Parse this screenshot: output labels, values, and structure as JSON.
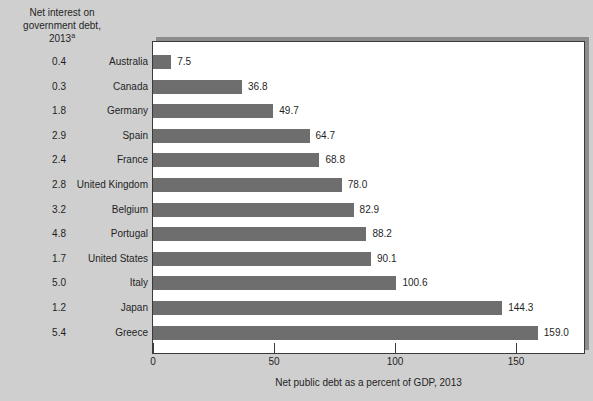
{
  "chart_data": {
    "type": "bar",
    "orientation": "horizontal",
    "title": "",
    "xlabel": "Net public debt as a percent of GDP, 2013",
    "ylabel": "",
    "xlim": [
      0,
      180
    ],
    "xticks": [
      0,
      50,
      100,
      150
    ],
    "xtick_labels": [
      "0",
      "50",
      "100",
      "150"
    ],
    "grid": false,
    "legend": "none",
    "bar_color": "#6e6e6e",
    "background_color": "#cfcfcf",
    "plot_background_color": "#ffffff",
    "categories": [
      "Australia",
      "Canada",
      "Germany",
      "Spain",
      "France",
      "United Kingdom",
      "Belgium",
      "Portugal",
      "United States",
      "Italy",
      "Japan",
      "Greece"
    ],
    "values": [
      7.5,
      36.8,
      49.7,
      64.7,
      68.8,
      78.0,
      82.9,
      88.2,
      90.1,
      100.6,
      144.3,
      159.0
    ],
    "value_labels": [
      "7.5",
      "36.8",
      "49.7",
      "64.7",
      "68.8",
      "78.0",
      "82.9",
      "88.2",
      "90.1",
      "100.6",
      "144.3",
      "159.0"
    ],
    "series": [
      {
        "name": "Net public debt as a percent of GDP, 2013",
        "values": [
          7.5,
          36.8,
          49.7,
          64.7,
          68.8,
          78.0,
          82.9,
          88.2,
          90.1,
          100.6,
          144.3,
          159.0
        ]
      },
      {
        "name": "Net interest on government debt, 2013",
        "values": [
          0.4,
          0.3,
          1.8,
          2.9,
          2.4,
          2.8,
          3.2,
          4.8,
          1.7,
          5.0,
          1.2,
          5.4
        ]
      }
    ]
  },
  "left_header": {
    "line1": "Net interest on",
    "line2": "government debt,",
    "line3": "2013",
    "footnote_marker": "a"
  },
  "rows": [
    {
      "interest": "0.4",
      "country": "Australia",
      "value": "7.5",
      "value_num": 7.5
    },
    {
      "interest": "0.3",
      "country": "Canada",
      "value": "36.8",
      "value_num": 36.8
    },
    {
      "interest": "1.8",
      "country": "Germany",
      "value": "49.7",
      "value_num": 49.7
    },
    {
      "interest": "2.9",
      "country": "Spain",
      "value": "64.7",
      "value_num": 64.7
    },
    {
      "interest": "2.4",
      "country": "France",
      "value": "68.8",
      "value_num": 68.8
    },
    {
      "interest": "2.8",
      "country": "United Kingdom",
      "value": "78.0",
      "value_num": 78.0
    },
    {
      "interest": "3.2",
      "country": "Belgium",
      "value": "82.9",
      "value_num": 82.9
    },
    {
      "interest": "4.8",
      "country": "Portugal",
      "value": "88.2",
      "value_num": 88.2
    },
    {
      "interest": "1.7",
      "country": "United States",
      "value": "90.1",
      "value_num": 90.1
    },
    {
      "interest": "5.0",
      "country": "Italy",
      "value": "100.6",
      "value_num": 100.6
    },
    {
      "interest": "1.2",
      "country": "Japan",
      "value": "144.3",
      "value_num": 144.3
    },
    {
      "interest": "5.4",
      "country": "Greece",
      "value": "159.0",
      "value_num": 159.0
    }
  ],
  "axis": {
    "ticks": [
      {
        "label": "0",
        "value": 0
      },
      {
        "label": "50",
        "value": 50
      },
      {
        "label": "100",
        "value": 100
      },
      {
        "label": "150",
        "value": 150
      }
    ],
    "title": "Net public debt as a percent of GDP, 2013"
  }
}
